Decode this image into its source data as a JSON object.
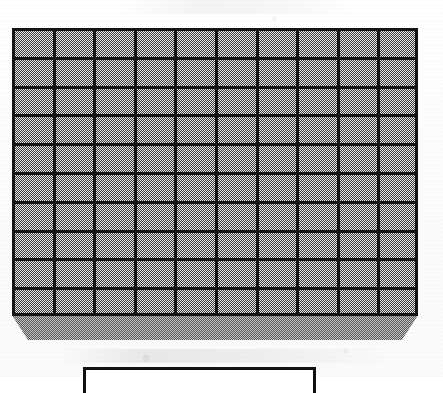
{
  "document": {
    "title": "Grid Panel Technical Drawing",
    "media": "scanned-line-drawing",
    "background_color": "#fdfdfd"
  },
  "panel": {
    "name": "gridded-panel",
    "description": "Rectangular panel with a regular rectangular grid of cells and a chamfered base slab",
    "grid": {
      "columns": 10,
      "rows": 10,
      "total_cells": 100,
      "line_color": "#141414",
      "cell_fill_color": "#aaaaaa",
      "cell_fill_pattern": "halftone-dither-checkerboard",
      "line_weight_px": 3
    },
    "base": {
      "name": "chamfered-base-slab",
      "fill_color": "#8d8d8d",
      "fill_pattern": "dark-halftone-dither",
      "chamfer": "bottom-left and bottom-right corners beveled"
    },
    "bounds": {
      "left": 12,
      "top": 28,
      "width": 406,
      "face_height": 288,
      "base_height": 312
    }
  },
  "label_box": {
    "name": "caption-frame",
    "text": "",
    "border_color": "#111111",
    "left": 83,
    "top": 367,
    "width": 233,
    "cropped": "bottom edge below image boundary"
  },
  "artifacts": {
    "top_smudge": "faint horizontal scan smudge near top edge",
    "bottom_smudge": "faint horizontal scan smudge below the panel base"
  }
}
